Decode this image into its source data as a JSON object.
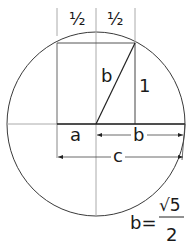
{
  "labels": {
    "half_left": "½",
    "half_right": "½",
    "hyp_b": "b",
    "side_one": "1",
    "seg_a": "a",
    "seg_b": "b",
    "seg_c": "c"
  },
  "formula": {
    "lhs": "b=",
    "numerator": "√5",
    "denominator": "2"
  },
  "colors": {
    "stroke": "#2a2a2a",
    "thin": "#9a9a9a",
    "text": "#1a1a1a"
  }
}
